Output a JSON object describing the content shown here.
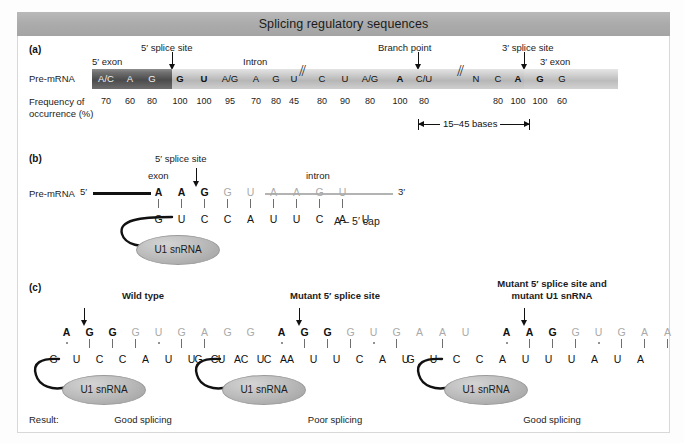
{
  "figure": {
    "title": "Splicing regulatory sequences"
  },
  "panel_a": {
    "tag": "(a)",
    "row_label": "Pre-mRNA",
    "freq_label_line1": "Frequency of",
    "freq_label_line2": "occurrence (%)",
    "exon5_label": "5′ exon",
    "exon3_label": "3′ exon",
    "intron_label": "Intron",
    "splice5_label": "5′ splice site",
    "splice3_label": "3′ splice site",
    "branch_label": "Branch point",
    "bracket_label": "15–45 bases",
    "sequence": [
      {
        "base": "A/C",
        "freq": "70",
        "bold": false,
        "region": "exon5"
      },
      {
        "base": "A",
        "freq": "60",
        "bold": false,
        "region": "exon5"
      },
      {
        "base": "G",
        "freq": "80",
        "bold": false,
        "region": "exon5"
      },
      {
        "base": "G",
        "freq": "100",
        "bold": true,
        "region": "intron"
      },
      {
        "base": "U",
        "freq": "100",
        "bold": true,
        "region": "intron"
      },
      {
        "base": "A/G",
        "freq": "95",
        "bold": false,
        "region": "intron"
      },
      {
        "base": "A",
        "freq": "70",
        "bold": false,
        "region": "intron"
      },
      {
        "base": "G",
        "freq": "80",
        "bold": false,
        "region": "intron"
      },
      {
        "base": "U",
        "freq": "45",
        "bold": false,
        "region": "intron"
      },
      {
        "base": "C",
        "freq": "80",
        "bold": false,
        "region": "intron"
      },
      {
        "base": "U",
        "freq": "90",
        "bold": false,
        "region": "intron"
      },
      {
        "base": "A/G",
        "freq": "80",
        "bold": false,
        "region": "intron"
      },
      {
        "base": "A",
        "freq": "100",
        "bold": true,
        "region": "intron"
      },
      {
        "base": "C/U",
        "freq": "80",
        "bold": false,
        "region": "intron"
      },
      {
        "base": "N",
        "freq": "",
        "bold": false,
        "region": "intron"
      },
      {
        "base": "C",
        "freq": "80",
        "bold": false,
        "region": "intron"
      },
      {
        "base": "A",
        "freq": "100",
        "bold": true,
        "region": "intron"
      },
      {
        "base": "G",
        "freq": "100",
        "bold": true,
        "region": "intron"
      },
      {
        "base": "G",
        "freq": "60",
        "bold": false,
        "region": "exon3"
      }
    ]
  },
  "panel_b": {
    "tag": "(b)",
    "row_label": "Pre-mRNA",
    "five_prime": "5′",
    "three_prime": "3′",
    "exon_label": "exon",
    "intron_label": "intron",
    "splice5_label": "5′ splice site",
    "cap_label": "A – 5′ cap",
    "snrna_label": "U1 snRNA",
    "top_seq": [
      "A",
      "A",
      "G",
      "G",
      "U",
      "A",
      "A",
      "G",
      "U"
    ],
    "top_kinds": [
      "exon",
      "exon",
      "exon",
      "intron",
      "intron",
      "intron",
      "intron",
      "intron",
      "intron"
    ],
    "bottom_seq": [
      "G",
      "U",
      "C",
      "C",
      "A",
      "U",
      "U",
      "C",
      "A",
      "U"
    ],
    "bonds": [
      "line",
      "line",
      "line",
      "line",
      "line",
      "line",
      "line",
      "line",
      "line"
    ]
  },
  "panel_c": {
    "tag": "(c)",
    "result_label": "Result:",
    "snrna_label": "U1 snRNA",
    "cases": [
      {
        "title": "Wild type",
        "title_line2": "",
        "top_seq": [
          "A",
          "G",
          "G",
          "G",
          "U",
          "G",
          "A",
          "G",
          "G"
        ],
        "top_kinds": [
          "exon",
          "exon",
          "exon",
          "intron",
          "intron",
          "intron",
          "intron",
          "intron",
          "intron"
        ],
        "bottom_seq": [
          "G",
          "U",
          "C",
          "C",
          "A",
          "U",
          "U",
          "C",
          "A",
          "U",
          "A"
        ],
        "bonds": [
          "dot",
          "line",
          "line",
          "line",
          "dot",
          "line",
          "line"
        ],
        "result": "Good splicing"
      },
      {
        "title": "Mutant 5′ splice site",
        "title_line2": "",
        "top_seq": [
          "A",
          "G",
          "G",
          "G",
          "U",
          "G",
          "A",
          "A",
          "U"
        ],
        "top_kinds": [
          "exon",
          "exon",
          "exon",
          "intron",
          "intron",
          "intron",
          "intron",
          "intron",
          "intron"
        ],
        "bottom_seq": [
          "G",
          "U",
          "C",
          "C",
          "A",
          "U",
          "U",
          "C",
          "A",
          "U"
        ],
        "bonds": [
          "dot",
          "line",
          "line",
          "line",
          "dot",
          "line",
          "none",
          "line"
        ],
        "result": "Poor splicing"
      },
      {
        "title": "Mutant 5′ splice site and",
        "title_line2": "mutant U1 snRNA",
        "top_seq": [
          "A",
          "A",
          "G",
          "G",
          "U",
          "G",
          "A",
          "A",
          "U"
        ],
        "top_kinds": [
          "exon",
          "exon",
          "exon",
          "intron",
          "intron",
          "intron",
          "intron",
          "intron",
          "intron"
        ],
        "bottom_seq": [
          "G",
          "U",
          "C",
          "C",
          "A",
          "U",
          "U",
          "U",
          "A",
          "U",
          "A"
        ],
        "bonds": [
          "dot",
          "line",
          "line",
          "line",
          "dot",
          "line",
          "line",
          "line"
        ],
        "result": "Good splicing"
      }
    ]
  }
}
